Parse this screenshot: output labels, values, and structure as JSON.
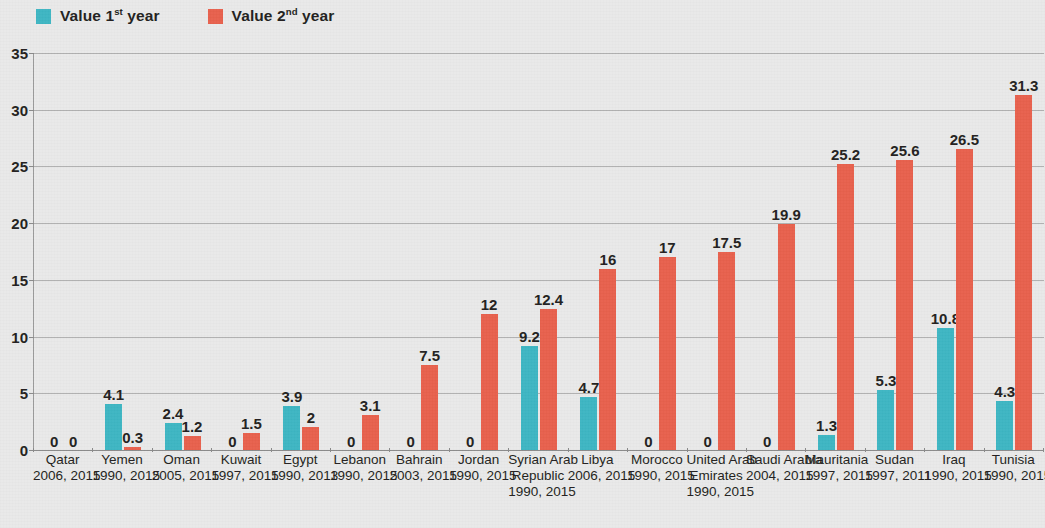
{
  "legend": {
    "items": [
      {
        "label_prefix": "Value 1",
        "label_sup": "st",
        "label_suffix": "year",
        "color": "#3eb6c3",
        "icon": "square-swatch-icon"
      },
      {
        "label_prefix": "Value 2",
        "label_sup": "nd",
        "label_suffix": "year",
        "color": "#e8614d",
        "icon": "square-swatch-icon"
      }
    ]
  },
  "axis": {
    "y_ticks": [
      "35",
      "30",
      "25",
      "20",
      "15",
      "10",
      "5",
      "0"
    ]
  },
  "chart_data": {
    "type": "bar",
    "title": "",
    "xlabel": "",
    "ylabel": "",
    "ylim": [
      0,
      35
    ],
    "ytick_step": 5,
    "grid": true,
    "legend_position": "top-left",
    "categories": [
      "Qatar",
      "Yemen",
      "Oman",
      "Kuwait",
      "Egypt",
      "Lebanon",
      "Bahrain",
      "Jordan",
      "Syrian Arab Republic",
      "Libya",
      "Morocco",
      "United Arab Emirates",
      "Saudi Arabia",
      "Mauritania",
      "Sudan",
      "Iraq",
      "Tunisia"
    ],
    "category_years": [
      "2006, 2015",
      "1990, 2015",
      "2005, 2015",
      "1997, 2015",
      "1990, 2013",
      "1990, 2015",
      "2003, 2015",
      "1990, 2015",
      "1990, 2015",
      "2006, 2015",
      "1990, 2015",
      "1990, 2015",
      "2004, 2015",
      "1997, 2015",
      "1997, 2011",
      "1990, 2015",
      "1990, 2015"
    ],
    "category_name_lines": [
      [
        "Qatar"
      ],
      [
        "Yemen"
      ],
      [
        "Oman"
      ],
      [
        "Kuwait"
      ],
      [
        "Egypt"
      ],
      [
        "Lebanon"
      ],
      [
        "Bahrain"
      ],
      [
        "Jordan"
      ],
      [
        "Syrian Arab",
        "Republic"
      ],
      [
        "Libya"
      ],
      [
        "Morocco"
      ],
      [
        "United Arab",
        "Emirates"
      ],
      [
        "Saudi Arabia"
      ],
      [
        "Mauritania"
      ],
      [
        "Sudan"
      ],
      [
        "Iraq"
      ],
      [
        "Tunisia"
      ]
    ],
    "series": [
      {
        "name": "Value 1st year",
        "color": "#3eb6c3",
        "values": [
          0,
          4.1,
          2.4,
          0,
          3.9,
          0,
          0,
          0,
          9.2,
          4.7,
          0,
          0,
          0,
          1.3,
          5.3,
          10.8,
          4.3
        ],
        "labels": [
          "0",
          "4.1",
          "2.4",
          "0",
          "3.9",
          "0",
          "0",
          "0",
          "9.2",
          "4.7",
          "0",
          "0",
          "0",
          "1.3",
          "5.3",
          "10.8",
          "4.3"
        ]
      },
      {
        "name": "Value 2nd year",
        "color": "#e8614d",
        "values": [
          0,
          0.3,
          1.2,
          1.5,
          2,
          3.1,
          7.5,
          12,
          12.4,
          16,
          17,
          17.5,
          19.9,
          25.2,
          25.6,
          26.5,
          31.3
        ],
        "labels": [
          "0",
          "0.3",
          "1.2",
          "1.5",
          "2",
          "3.1",
          "7.5",
          "12",
          "12.4",
          "16",
          "17",
          "17.5",
          "19.9",
          "25.2",
          "25.6",
          "26.5",
          "31.3"
        ]
      }
    ]
  }
}
